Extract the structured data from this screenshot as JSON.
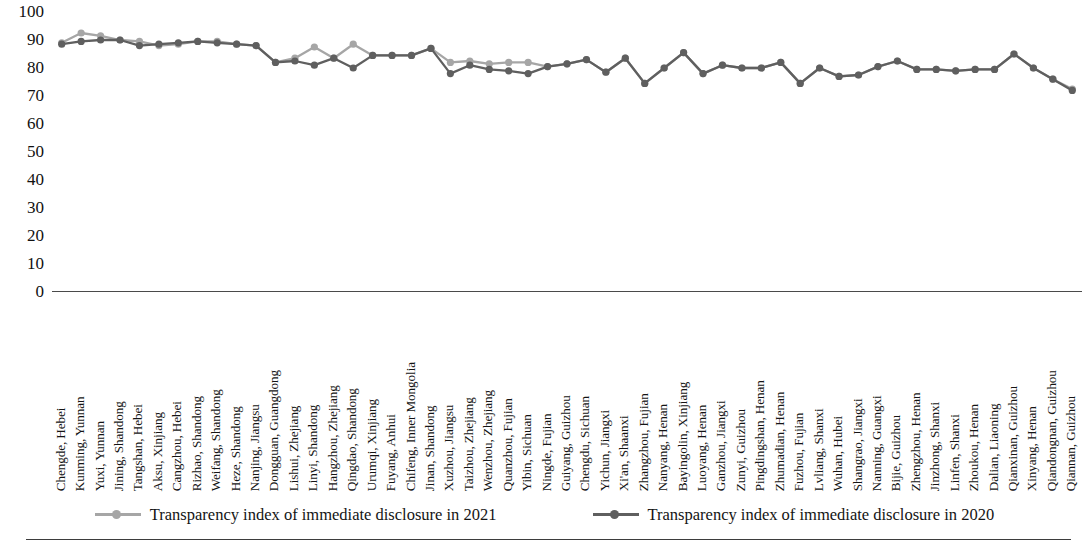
{
  "chart_data": {
    "type": "line",
    "title": "",
    "xlabel": "",
    "ylabel": "",
    "ylim": [
      0,
      100
    ],
    "ytick_step": 10,
    "ytick_labels": [
      "100",
      "90",
      "80",
      "70",
      "60",
      "50",
      "40",
      "30",
      "20",
      "10",
      "0"
    ],
    "grid": false,
    "legend_position": "bottom",
    "categories": [
      "Chengde, Hebei",
      "Kunming, Yunnan",
      "Yuxi, Yunnan",
      "Jining, Shandong",
      "Tangshan, Hebei",
      "Aksu, Xinjiang",
      "Cangzhou, Hebei",
      "Rizhao, Shandong",
      "Weifang, Shandong",
      "Heze, Shandong",
      "Nanjing, Jiangsu",
      "Dongguan, Guangdong",
      "Lishui, Zhejiang",
      "Linyi, Shandong",
      "Hangzhou, Zhejiang",
      "Qingdao, Shandong",
      "Urumqi, Xinjiang",
      "Fuyang, Anhui",
      "Chifeng, Inner Mongolia",
      "Jinan, Shandong",
      "Xuzhou, Jiangsu",
      "Taizhou, Zhejiang",
      "Wenzhou, Zhejiang",
      "Quanzhou, Fujian",
      "Yibin, Sichuan",
      "Ningde, Fujian",
      "Guiyang, Guizhou",
      "Chengdu, Sichuan",
      "Yichun, Jiangxi",
      "Xi'an, Shaanxi",
      "Zhangzhou, Fujian",
      "Nanyang, Henan",
      "Bayingolin, Xinjiang",
      "Luoyang, Henan",
      "Ganzhou, Jiangxi",
      "Zunyi, Guizhou",
      "Pingdingshan, Henan",
      "Zhumadian, Henan",
      "Fuzhou, Fujian",
      "Lvliang, Shanxi",
      "Wuhan, Hubei",
      "Shangrao, Jiangxi",
      "Nanning, Guangxi",
      "Bijie, Guizhou",
      "Zhengzhou, Henan",
      "Jinzhong, Shanxi",
      "Linfen, Shanxi",
      "Zhoukou, Henan",
      "Dalian, Liaoning",
      "Qianxinan, Guizhou",
      "Xinyang, Henan",
      "Qiandongnan, Guizhou",
      "Qiannan, Guizhou"
    ],
    "series": [
      {
        "name": "Transparency index of immediate disclosure in 2021",
        "color": "#a6a6a6",
        "values": [
          89.0,
          92.5,
          91.5,
          90.0,
          89.5,
          88.0,
          88.5,
          89.5,
          89.5,
          88.5,
          88.0,
          82.0,
          83.5,
          87.5,
          83.5,
          88.5,
          84.5,
          84.5,
          84.5,
          87.0,
          82.0,
          82.5,
          81.5,
          82.0,
          82.0,
          80.5,
          81.5,
          83.0,
          78.5,
          83.5,
          74.5,
          80.0,
          85.5,
          78.0,
          81.0,
          80.0,
          80.0,
          82.0,
          74.5,
          80.0,
          77.0,
          77.5,
          80.5,
          82.5,
          79.5,
          79.5,
          79.0,
          79.5,
          79.5,
          85.0,
          80.0,
          76.0,
          72.5
        ]
      },
      {
        "name": "Transparency index of immediate disclosure in 2020",
        "color": "#5f5f5f",
        "values": [
          88.5,
          89.5,
          90.0,
          90.0,
          88.0,
          88.5,
          89.0,
          89.5,
          89.0,
          88.5,
          88.0,
          82.0,
          82.5,
          81.0,
          83.5,
          80.0,
          84.5,
          84.5,
          84.5,
          87.0,
          78.0,
          81.0,
          79.5,
          79.0,
          78.0,
          80.5,
          81.5,
          83.0,
          78.5,
          83.5,
          74.5,
          80.0,
          85.5,
          78.0,
          81.0,
          80.0,
          80.0,
          82.0,
          74.5,
          80.0,
          77.0,
          77.5,
          80.5,
          82.5,
          79.5,
          79.5,
          79.0,
          79.5,
          79.5,
          85.0,
          80.0,
          76.0,
          72.0
        ]
      }
    ]
  },
  "legend": [
    {
      "label": "Transparency index of immediate disclosure in 2021",
      "color": "#a6a6a6"
    },
    {
      "label": "Transparency index of immediate disclosure in 2020",
      "color": "#5f5f5f"
    }
  ],
  "colors": {
    "series_2021": "#a6a6a6",
    "series_2020": "#5f5f5f",
    "axis": "#4a4a4a",
    "text": "#141414",
    "background": "#ffffff"
  }
}
